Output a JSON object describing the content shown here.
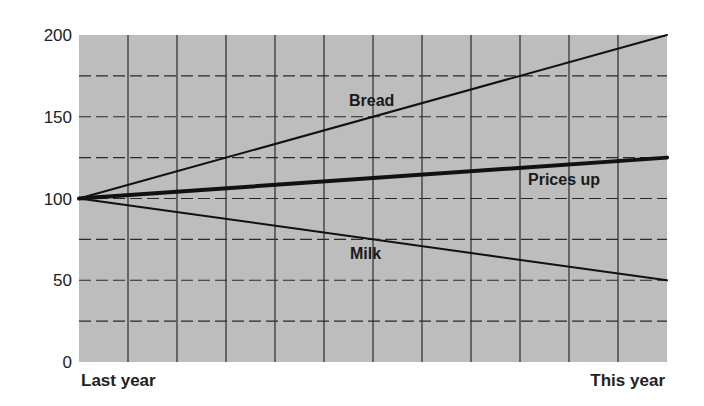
{
  "chart_data": {
    "type": "line",
    "title": "",
    "xlabel": "",
    "ylabel": "",
    "x": [
      "Last year",
      "This year"
    ],
    "x_tick_labels": [
      "Last year",
      "This year"
    ],
    "y_ticks": [
      0,
      50,
      100,
      150,
      200
    ],
    "ylim": [
      0,
      200
    ],
    "grid": {
      "vertical_lines": 11,
      "horizontal_solid": [],
      "horizontal_dashed": [
        25,
        50,
        75,
        100,
        125,
        150,
        175
      ]
    },
    "series": [
      {
        "name": "Bread",
        "values": [
          100,
          200
        ],
        "weight": "thin"
      },
      {
        "name": "Prices up",
        "values": [
          100,
          125
        ],
        "weight": "thick"
      },
      {
        "name": "Milk",
        "values": [
          100,
          50
        ],
        "weight": "thin"
      }
    ],
    "annotations": [
      {
        "text": "Bread",
        "series": "Bread"
      },
      {
        "text": "Prices up",
        "series": "Prices up"
      },
      {
        "text": "Milk",
        "series": "Milk"
      }
    ],
    "legend": "none (inline labels)"
  },
  "colors": {
    "plot_background": "#bdbdbd",
    "line": "#111111",
    "grid": "#2a2a2a"
  }
}
